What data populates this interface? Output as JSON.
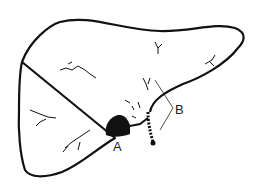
{
  "diagram": {
    "labels": {
      "a": "A",
      "b": "B"
    },
    "colors": {
      "line": "#111111",
      "background": "#ffffff"
    }
  }
}
